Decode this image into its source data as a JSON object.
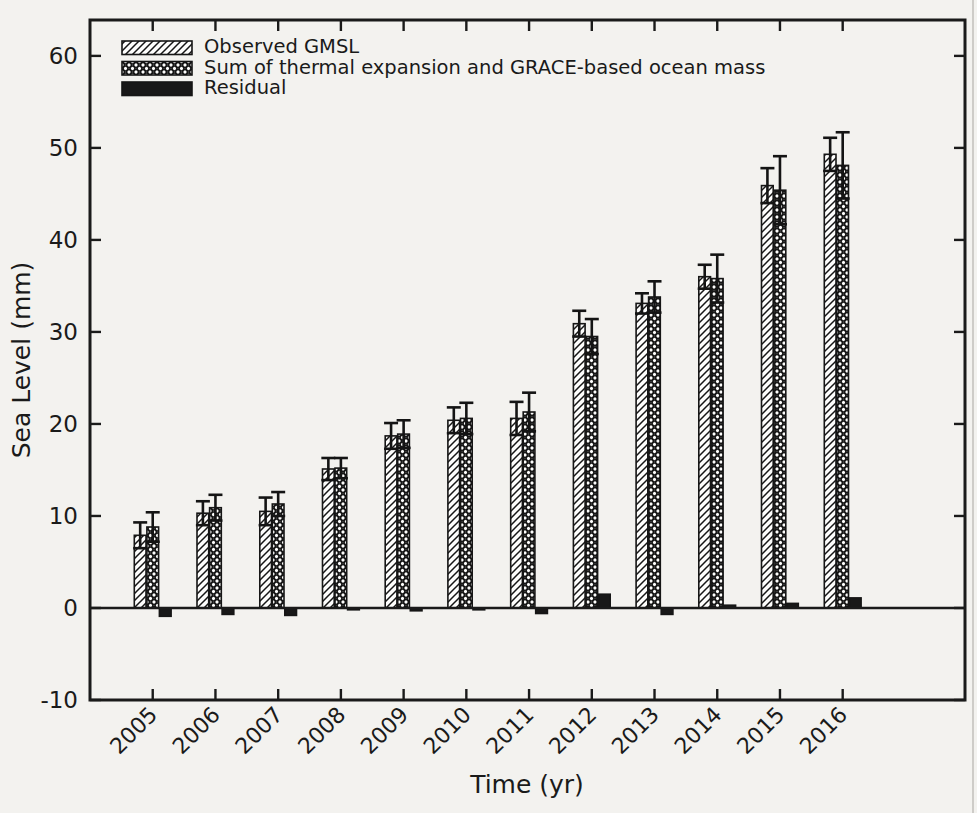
{
  "figure": {
    "paper_color": "#f3f2ef",
    "ink_color": "#1a1a1a",
    "page_edge_color": "#bdbcb8"
  },
  "chart_data": {
    "type": "bar",
    "title": "",
    "xlabel": "Time (yr)",
    "ylabel": "Sea Level (mm)",
    "grid": false,
    "legend_position": "upper-left",
    "xlim": [
      2004,
      2017.95
    ],
    "ylim": [
      -10,
      63.9
    ],
    "yticks": [
      -10,
      0,
      10,
      20,
      30,
      40,
      50,
      60
    ],
    "ytick_labels": [
      "-10",
      "0",
      "10",
      "20",
      "30",
      "40",
      "50",
      "60"
    ],
    "categories": [
      "2005",
      "2006",
      "2007",
      "2008",
      "2009",
      "2010",
      "2011",
      "2012",
      "2013",
      "2014",
      "2015",
      "2016"
    ],
    "bar_width_years": 0.2,
    "series": [
      {
        "name": "Observed GMSL",
        "style": "diagonal-hatch",
        "values": [
          7.9,
          10.3,
          10.5,
          15.1,
          18.7,
          20.4,
          20.6,
          30.9,
          33.1,
          36.0,
          45.9,
          49.3
        ],
        "errors": [
          1.4,
          1.3,
          1.5,
          1.2,
          1.4,
          1.4,
          1.8,
          1.4,
          1.1,
          1.3,
          1.9,
          1.8
        ]
      },
      {
        "name": "Sum of thermal expansion and GRACE-based ocean mass",
        "style": "circle-hatch",
        "values": [
          8.8,
          10.9,
          11.3,
          15.2,
          18.9,
          20.6,
          21.3,
          29.5,
          33.8,
          35.8,
          45.4,
          48.1
        ],
        "errors": [
          1.6,
          1.4,
          1.3,
          1.1,
          1.5,
          1.7,
          2.1,
          1.9,
          1.7,
          2.6,
          3.7,
          3.6
        ]
      },
      {
        "name": "Residual",
        "style": "solid-black",
        "values": [
          -0.9,
          -0.7,
          -0.8,
          -0.2,
          -0.3,
          -0.2,
          -0.6,
          1.5,
          -0.7,
          0.3,
          0.5,
          1.1
        ],
        "errors": null
      }
    ]
  }
}
